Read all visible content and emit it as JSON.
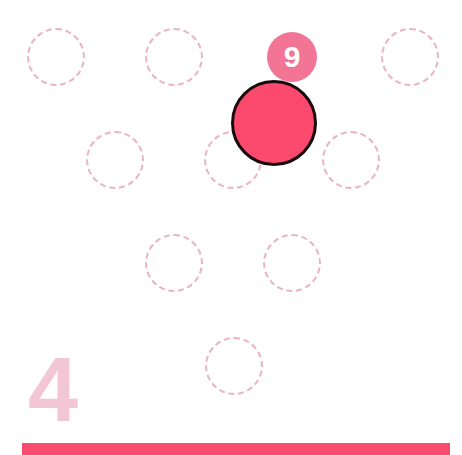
{
  "game": {
    "level_number": "4",
    "badge_value": "9",
    "colors": {
      "slot_border": "#eab3c4",
      "badge_fill": "#f27596",
      "piece_fill": "#fb4a6e",
      "piece_border": "#1a0a0d",
      "level_text": "#f2c6d4",
      "bottom_bar": "#fa4b70"
    },
    "slots": [
      {
        "x": 56,
        "y": 57
      },
      {
        "x": 174,
        "y": 57
      },
      {
        "x": 410,
        "y": 57
      },
      {
        "x": 115,
        "y": 160
      },
      {
        "x": 233,
        "y": 160
      },
      {
        "x": 351,
        "y": 160
      },
      {
        "x": 174,
        "y": 263
      },
      {
        "x": 292,
        "y": 263
      },
      {
        "x": 234,
        "y": 366
      }
    ],
    "badge": {
      "x": 292,
      "y": 57,
      "diameter": 50
    },
    "piece": {
      "x": 274,
      "y": 123,
      "diameter": 86
    }
  }
}
